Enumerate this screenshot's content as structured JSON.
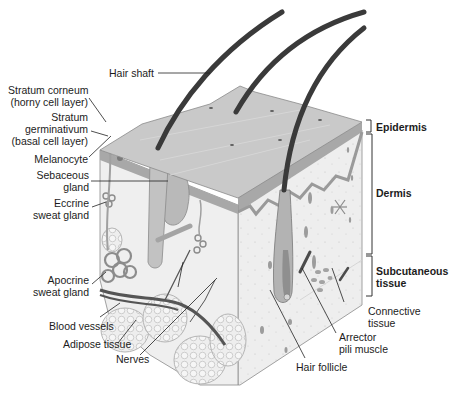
{
  "figure": {
    "labels_left": [
      {
        "id": "hair-shaft",
        "text": "Hair shaft"
      },
      {
        "id": "stratum-corneum",
        "lines": [
          "Stratum corneum",
          "(horny cell layer)"
        ]
      },
      {
        "id": "stratum-germinativum",
        "lines": [
          "Stratum",
          "germinativum",
          "(basal cell layer)"
        ]
      },
      {
        "id": "melanocyte",
        "text": "Melanocyte"
      },
      {
        "id": "sebaceous-gland",
        "lines": [
          "Sebaceous",
          "gland"
        ]
      },
      {
        "id": "eccrine-sweat-gland",
        "lines": [
          "Eccrine",
          "sweat gland"
        ]
      },
      {
        "id": "apocrine-sweat-gland",
        "lines": [
          "Apocrine",
          "sweat gland"
        ]
      },
      {
        "id": "blood-vessels",
        "text": "Blood vessels"
      },
      {
        "id": "adipose-tissue",
        "text": "Adipose tissue"
      },
      {
        "id": "nerves",
        "text": "Nerves"
      }
    ],
    "labels_right": [
      {
        "id": "connective-tissue",
        "lines": [
          "Connective",
          "tissue"
        ]
      },
      {
        "id": "arrector-pili-muscle",
        "lines": [
          "Arrector",
          "pili muscle"
        ]
      },
      {
        "id": "hair-follicle",
        "text": "Hair follicle"
      }
    ],
    "layers": [
      {
        "id": "epidermis",
        "text": "Epidermis"
      },
      {
        "id": "dermis",
        "text": "Dermis"
      },
      {
        "id": "subcutaneous",
        "lines": [
          "Subcutaneous",
          "tissue"
        ]
      }
    ],
    "colors": {
      "surface": "#c9c9c9",
      "epidermis_edge": "#9a9a9a",
      "dermis": "#ececec",
      "hair": "#3a3a3a",
      "vessel": "#5c5c5c",
      "leader": "#222222"
    }
  }
}
